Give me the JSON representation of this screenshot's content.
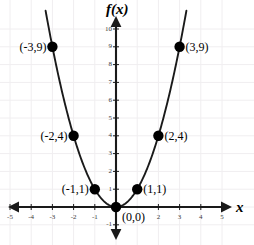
{
  "chart_data": {
    "type": "line",
    "title": "",
    "xlabel": "x",
    "ylabel": "f(x)",
    "function": "f(x) = x^2",
    "xlim": [
      -5.5,
      5.5
    ],
    "ylim": [
      -1.6,
      10.6
    ],
    "grid": true,
    "legend": null,
    "x_ticks": [
      {
        "value": -5,
        "label": "-5"
      },
      {
        "value": -4,
        "label": "-4"
      },
      {
        "value": -3,
        "label": "-3"
      },
      {
        "value": -2,
        "label": "-2"
      },
      {
        "value": -1,
        "label": "-1"
      },
      {
        "value": 2,
        "label": "2"
      },
      {
        "value": 3,
        "label": "3"
      },
      {
        "value": 4,
        "label": "4"
      },
      {
        "value": 5,
        "label": "5"
      }
    ],
    "y_ticks": [
      {
        "value": 10,
        "label": "10"
      },
      {
        "value": 9,
        "label": "9"
      },
      {
        "value": 8,
        "label": "8"
      },
      {
        "value": 7,
        "label": "7"
      },
      {
        "value": 6,
        "label": "6"
      },
      {
        "value": 5,
        "label": "5"
      },
      {
        "value": 4,
        "label": "4"
      },
      {
        "value": 3,
        "label": "3"
      },
      {
        "value": 2,
        "label": "2"
      },
      {
        "value": 1,
        "label": "1"
      },
      {
        "value": -1,
        "label": "-1"
      }
    ],
    "points": [
      {
        "x": -3,
        "y": 9,
        "label": "(-3,9)",
        "side": "left"
      },
      {
        "x": -2,
        "y": 4,
        "label": "(-2,4)",
        "side": "left"
      },
      {
        "x": -1,
        "y": 1,
        "label": "(-1,1)",
        "side": "left"
      },
      {
        "x": 0,
        "y": 0,
        "label": "(0,0)",
        "side": "right"
      },
      {
        "x": 1,
        "y": 1,
        "label": "(1,1)",
        "side": "right"
      },
      {
        "x": 2,
        "y": 4,
        "label": "(2,4)",
        "side": "right"
      },
      {
        "x": 3,
        "y": 9,
        "label": "(3,9)",
        "side": "right"
      }
    ],
    "curve_x_range": [
      -3.32,
      3.32
    ],
    "colors": {
      "curve": "#1a1a1a",
      "axis": "#1a1a1a",
      "point": "#000000",
      "grid": "#f0eef0",
      "background": "#ffffff",
      "tick_text": "#3a3a3a"
    }
  },
  "geometry": {
    "origin_x": 116,
    "origin_y": 207,
    "unit_x": 21.2,
    "unit_y": 17.8,
    "point_radius": 5.2
  }
}
